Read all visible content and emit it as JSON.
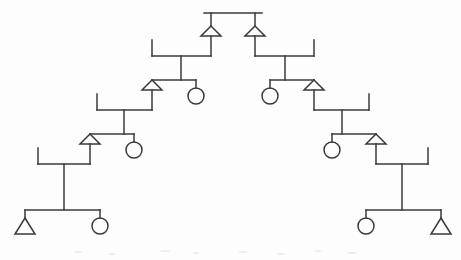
{
  "figure": {
    "diagram_type": "kinship-chart",
    "width": 461,
    "height": 260,
    "background_color": "#fdfdfd",
    "line_color": "#3a3a3a",
    "line_width": 1.5,
    "symmetry": "bilateral-mirror-about-vertical-center"
  },
  "legend": {
    "male_symbol": "triangle",
    "female_symbol": "circle",
    "union_symbol": "horizontal-marriage-bar-with-outer-tick",
    "descent_symbol": "vertical-descent-line",
    "sibling_symbol": "horizontal-sibling-bar"
  },
  "geometry": {
    "triangle_half_width": 10,
    "triangle_height": 10,
    "circle_radius": 8,
    "stub_length": 8,
    "tick_length": 16
  },
  "chart_data": {
    "type": "diagram",
    "generations": 5,
    "apex": {
      "sibling_bar": {
        "x1": 204,
        "x2": 262,
        "y": 13
      },
      "children": [
        {
          "id": "m-apex-left",
          "sex": "male",
          "shape": "triangle",
          "cx": 211,
          "apex_y": 26,
          "base_y": 36
        },
        {
          "id": "m-apex-right",
          "sex": "male",
          "shape": "triangle",
          "cx": 255,
          "apex_y": 26,
          "base_y": 36
        }
      ]
    },
    "left_branch": {
      "direction": "down-left",
      "units": [
        {
          "generation": 2,
          "union_bar": {
            "x1": 152,
            "x2": 211,
            "y": 56
          },
          "outer_tick": {
            "x": 152,
            "y1": 40,
            "y2": 56
          },
          "descent": {
            "x": 181,
            "y1": 56,
            "y2": 80
          },
          "sibling_bar": {
            "x1": 152,
            "x2": 196,
            "y": 80
          },
          "children": [
            {
              "id": "m-g2-left",
              "sex": "male",
              "shape": "triangle",
              "cx": 152,
              "apex_y": 80,
              "base_y": 90
            },
            {
              "id": "f-g2-right",
              "sex": "female",
              "shape": "circle",
              "cx": 196,
              "cy": 96
            }
          ]
        },
        {
          "generation": 3,
          "union_bar": {
            "x1": 97,
            "x2": 152,
            "y": 110
          },
          "outer_tick": {
            "x": 97,
            "y1": 94,
            "y2": 110
          },
          "descent": {
            "x": 124,
            "y1": 110,
            "y2": 134
          },
          "sibling_bar": {
            "x1": 90,
            "x2": 134,
            "y": 134
          },
          "children": [
            {
              "id": "m-g3-left",
              "sex": "male",
              "shape": "triangle",
              "cx": 90,
              "apex_y": 134,
              "base_y": 144
            },
            {
              "id": "f-g3-right",
              "sex": "female",
              "shape": "circle",
              "cx": 134,
              "cy": 150
            }
          ]
        },
        {
          "generation": 4,
          "union_bar": {
            "x1": 38,
            "x2": 90,
            "y": 164
          },
          "outer_tick": {
            "x": 38,
            "y1": 148,
            "y2": 164
          },
          "descent": {
            "x": 64,
            "y1": 164,
            "y2": 210
          },
          "sibling_bar": {
            "x1": 25,
            "x2": 100,
            "y": 210
          },
          "children": [
            {
              "id": "m-g4-left",
              "sex": "male",
              "shape": "triangle",
              "cx": 25,
              "apex_y": 218,
              "base_y": 234
            },
            {
              "id": "f-g4-right",
              "sex": "female",
              "shape": "circle",
              "cx": 100,
              "cy": 226
            }
          ]
        }
      ]
    },
    "right_branch": {
      "direction": "down-right",
      "units": [
        {
          "generation": 2,
          "union_bar": {
            "x1": 255,
            "x2": 314,
            "y": 56
          },
          "outer_tick": {
            "x": 314,
            "y1": 40,
            "y2": 56
          },
          "descent": {
            "x": 285,
            "y1": 56,
            "y2": 80
          },
          "sibling_bar": {
            "x1": 270,
            "x2": 314,
            "y": 80
          },
          "children": [
            {
              "id": "f-g2-left",
              "sex": "female",
              "shape": "circle",
              "cx": 270,
              "cy": 96
            },
            {
              "id": "m-g2-right",
              "sex": "male",
              "shape": "triangle",
              "cx": 314,
              "apex_y": 80,
              "base_y": 90
            }
          ]
        },
        {
          "generation": 3,
          "union_bar": {
            "x1": 314,
            "x2": 369,
            "y": 110
          },
          "outer_tick": {
            "x": 369,
            "y1": 94,
            "y2": 110
          },
          "descent": {
            "x": 342,
            "y1": 110,
            "y2": 134
          },
          "sibling_bar": {
            "x1": 332,
            "x2": 376,
            "y": 134
          },
          "children": [
            {
              "id": "f-g3-left",
              "sex": "female",
              "shape": "circle",
              "cx": 332,
              "cy": 150
            },
            {
              "id": "m-g3-right",
              "sex": "male",
              "shape": "triangle",
              "cx": 376,
              "apex_y": 134,
              "base_y": 144
            }
          ]
        },
        {
          "generation": 4,
          "union_bar": {
            "x1": 376,
            "x2": 428,
            "y": 164
          },
          "outer_tick": {
            "x": 428,
            "y1": 148,
            "y2": 164
          },
          "descent": {
            "x": 402,
            "y1": 164,
            "y2": 210
          },
          "sibling_bar": {
            "x1": 366,
            "x2": 441,
            "y": 210
          },
          "children": [
            {
              "id": "f-g4-left",
              "sex": "female",
              "shape": "circle",
              "cx": 366,
              "cy": 226
            },
            {
              "id": "m-g4-right",
              "sex": "male",
              "shape": "triangle",
              "cx": 441,
              "apex_y": 218,
              "base_y": 234
            }
          ]
        }
      ]
    },
    "totals": {
      "male_nodes": 8,
      "female_nodes": 6,
      "union_bars": 6,
      "sibling_bars": 7
    }
  }
}
